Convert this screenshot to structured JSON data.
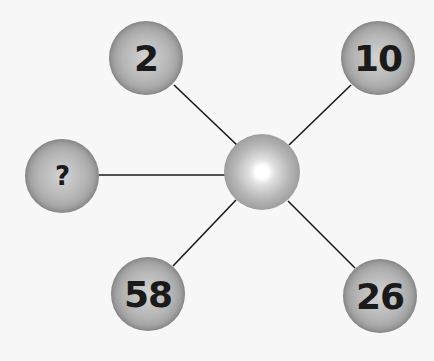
{
  "diagram": {
    "type": "number-puzzle-star",
    "center": {
      "label": "",
      "x": 262,
      "y": 172
    },
    "nodes": [
      {
        "id": "top-left",
        "label": "2",
        "x": 146,
        "y": 58
      },
      {
        "id": "top-right",
        "label": "10",
        "x": 378,
        "y": 58
      },
      {
        "id": "left",
        "label": "?",
        "x": 62,
        "y": 176
      },
      {
        "id": "bottom-left",
        "label": "58",
        "x": 148,
        "y": 294
      },
      {
        "id": "bottom-right",
        "label": "26",
        "x": 380,
        "y": 296
      }
    ],
    "line_color": "#1a1a1a"
  }
}
